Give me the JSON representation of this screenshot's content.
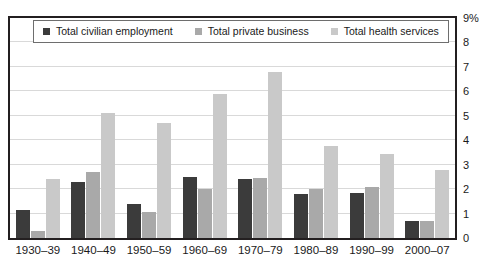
{
  "chart_data": {
    "type": "bar",
    "title": "",
    "xlabel": "",
    "ylabel": "",
    "ylim": [
      0,
      9
    ],
    "grid": true,
    "legend_position": "top-left-inside",
    "y_tick_labels": [
      "0",
      "1",
      "2",
      "3",
      "4",
      "5",
      "6",
      "7",
      "8",
      "9%"
    ],
    "y_tick_values": [
      0,
      1,
      2,
      3,
      4,
      5,
      6,
      7,
      8,
      9
    ],
    "categories": [
      "1930–39",
      "1940–49",
      "1950–59",
      "1960–69",
      "1970–79",
      "1980–89",
      "1990–99",
      "2000–07"
    ],
    "series": [
      {
        "name": "Total civilian employment",
        "color": "#3b3b3b",
        "values": [
          1.15,
          2.3,
          1.4,
          2.5,
          2.4,
          1.8,
          1.85,
          0.7
        ]
      },
      {
        "name": "Total private business",
        "color": "#a9a9a9",
        "values": [
          0.3,
          2.7,
          1.05,
          2.0,
          2.45,
          2.0,
          2.1,
          0.7
        ]
      },
      {
        "name": "Total health services",
        "color": "#c9c9c9",
        "values": [
          2.4,
          5.1,
          4.7,
          5.9,
          6.8,
          3.75,
          3.45,
          2.8
        ]
      }
    ]
  },
  "legend": {
    "items": [
      {
        "label": "Total civilian employment",
        "swatch": "#3b3b3b"
      },
      {
        "label": "Total private business",
        "swatch": "#a9a9a9"
      },
      {
        "label": "Total health services",
        "swatch": "#c9c9c9"
      }
    ]
  },
  "caption_remnant": ""
}
